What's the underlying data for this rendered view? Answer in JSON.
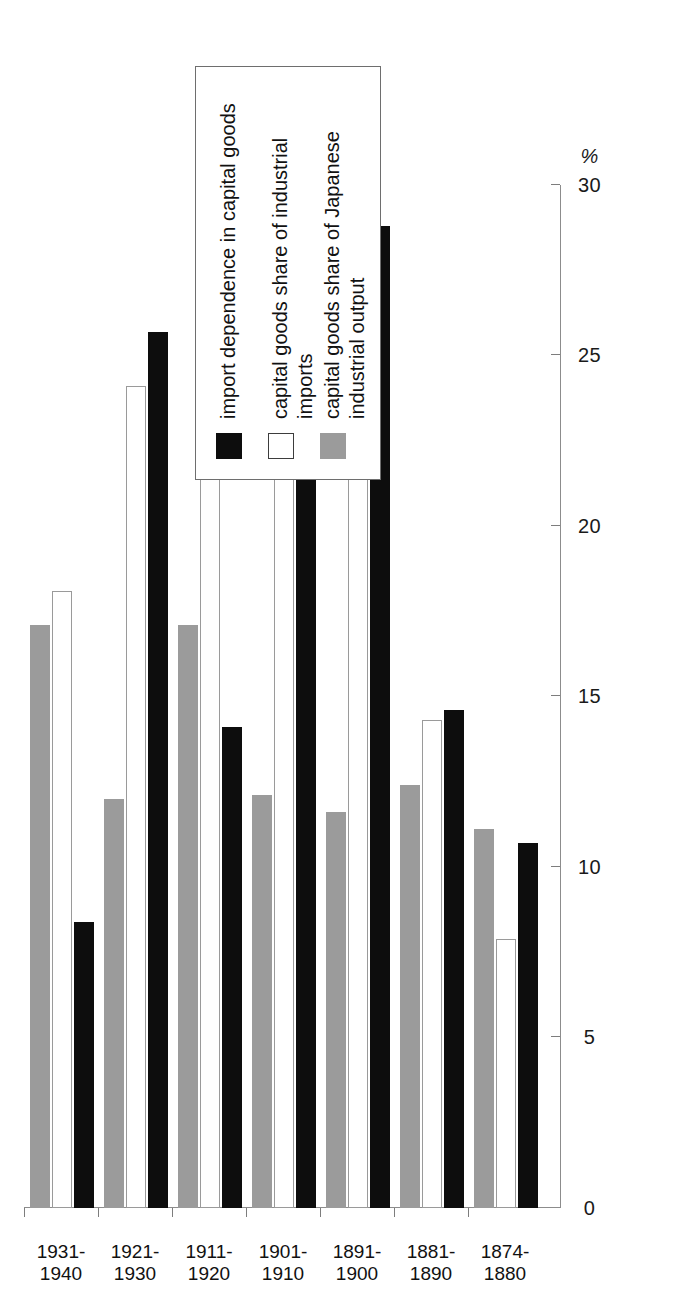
{
  "chart": {
    "type": "bar",
    "orientation": "rotated-90",
    "axis_title": "%",
    "ylim_min": 0,
    "ylim_max": 30,
    "tick_labels": [
      "0",
      "5",
      "10",
      "15",
      "20",
      "25",
      "30"
    ],
    "colors": {
      "black": "#0d0d0d",
      "white": "#ffffff",
      "gray": "#9b9b9b",
      "axis": "#8c8c8c"
    }
  },
  "legend": {
    "items": [
      {
        "swatch": "black",
        "label": "import dependence in capital goods"
      },
      {
        "swatch": "white",
        "label": "capital goods share of  industrial imports"
      },
      {
        "swatch": "gray",
        "label": "capital goods  share of  Japanese\nindustrial output"
      }
    ]
  },
  "chart_data": {
    "type": "bar",
    "title": "",
    "subtitle": "",
    "xlabel": "",
    "ylabel": "%",
    "ylim": [
      0,
      30
    ],
    "yticks": [
      0,
      5,
      10,
      15,
      20,
      25,
      30
    ],
    "grid": false,
    "legend_position": "right",
    "orientation": "horizontal-rotated",
    "categories": [
      "1874-\n1880",
      "1881-\n1890",
      "1891-\n1900",
      "1901-\n1910",
      "1911-\n1920",
      "1921-\n1930",
      "1931-\n1940"
    ],
    "category_labels_flat": [
      "1874-1880",
      "1881-1890",
      "1891-1900",
      "1901-1910",
      "1911-1920",
      "1921-1930",
      "1931-1940"
    ],
    "series": [
      {
        "name": "import dependence in capital goods",
        "swatch": "black",
        "values": [
          10.7,
          14.6,
          28.8,
          28.8,
          14.1,
          25.7,
          8.4
        ]
      },
      {
        "name": "capital goods share of  industrial imports",
        "swatch": "white",
        "values": [
          7.9,
          14.3,
          24.2,
          23.2,
          22.3,
          24.1,
          18.1
        ]
      },
      {
        "name": "capital goods  share of  Japanese industrial output",
        "swatch": "gray",
        "values": [
          11.1,
          12.4,
          11.6,
          12.1,
          17.1,
          12.0,
          17.1
        ]
      }
    ]
  }
}
